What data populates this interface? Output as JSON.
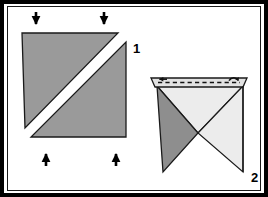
{
  "figure": {
    "panel_count": 2,
    "background_color": "#ffffff",
    "frame_color": "#000000",
    "outline_color": "#1a1a1a"
  },
  "palette": {
    "mid_gray": "#9a9a9a",
    "dark_gray": "#8e8e8e",
    "light_gray": "#ececec",
    "pale_gray": "#e2e2e2",
    "white": "#ffffff",
    "black": "#000000",
    "outline": "#1a1a1a"
  },
  "steps": [
    {
      "number": "1",
      "label": "1",
      "label_x": 133,
      "label_y": 42,
      "description": "Square sheet shown as two shaded right triangles separated by a white diagonal band; arrows press in from top and bottom.",
      "shapes": [
        {
          "name": "upper-left-triangle",
          "fill": "#9a9a9a",
          "points": "22,33 118,33 25,128"
        },
        {
          "name": "lower-right-triangle",
          "fill": "#9a9a9a",
          "points": "126,42 126,137 31,137"
        }
      ],
      "arrows": [
        {
          "name": "arrow-down-left",
          "direction": "down",
          "x": 36,
          "y_tail": 12,
          "y_head": 30
        },
        {
          "name": "arrow-down-right",
          "direction": "down",
          "x": 104,
          "y_tail": 12,
          "y_head": 30
        },
        {
          "name": "arrow-up-left",
          "direction": "up",
          "x": 46,
          "y_tail": 165,
          "y_head": 146
        },
        {
          "name": "arrow-up-right",
          "direction": "up",
          "x": 116,
          "y_tail": 165,
          "y_head": 146
        }
      ]
    },
    {
      "number": "2",
      "label": "2",
      "label_x": 251,
      "label_y": 171,
      "description": "Collapsed form: narrow horizontal flap across the top with a dashed fold line and small curl arrows at each end; dark triangle at left, light triangles at right.",
      "shapes": [
        {
          "name": "top-flap-strip",
          "fill": "#e2e2e2",
          "points": "151,78 247,78 243,87 155,87"
        },
        {
          "name": "left-dark-triangle",
          "fill": "#8e8e8e",
          "points": "157,86 198,133 163,172"
        },
        {
          "name": "right-light-upper-triangle",
          "fill": "#ececec",
          "points": "157,86 243,86 198,133"
        },
        {
          "name": "right-light-lower-triangle",
          "fill": "#ececec",
          "points": "243,86 243,172 198,133"
        }
      ],
      "fold_line": {
        "name": "dashed-fold-line",
        "style": "dashed",
        "x1": 157,
        "y1": 82,
        "x2": 241,
        "y2": 82
      },
      "curl_arrows": [
        {
          "name": "curl-arrow-left",
          "x": 160,
          "y": 80
        },
        {
          "name": "curl-arrow-right",
          "x": 232,
          "y": 80
        }
      ]
    }
  ]
}
